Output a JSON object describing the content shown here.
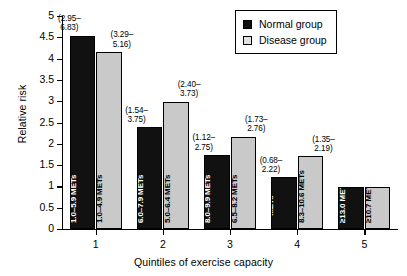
{
  "chart_data": {
    "type": "bar",
    "title": "",
    "xlabel": "Quintiles of exercise capacity",
    "ylabel": "Relative risk",
    "categories": [
      "1",
      "2",
      "3",
      "4",
      "5"
    ],
    "ylim": [
      0,
      5
    ],
    "ytick_labels": [
      "0",
      "0.5",
      "1",
      "1.5",
      "2",
      "2.5",
      "3",
      "3.5",
      "4",
      "4.5",
      "5"
    ],
    "ytick_values": [
      0,
      0.5,
      1,
      1.5,
      2,
      2.5,
      3,
      3.5,
      4,
      4.5,
      5
    ],
    "grid": false,
    "legend_position": "top-right",
    "series": [
      {
        "name": "Normal group",
        "color": "#111111",
        "values": [
          4.55,
          2.4,
          1.75,
          1.23,
          1.0
        ],
        "ci_labels": [
          "(2.95–\n6.83)",
          "(1.54–\n3.75)",
          "(1.12–\n2.75)",
          "(0.68–\n2.22)",
          ""
        ],
        "bar_labels": [
          "1.0–5.9 METs",
          "6.0–7.9 METs",
          "8.0–9.9 METs",
          "10.0–12.9\nMETs",
          "≥13.0 METs"
        ]
      },
      {
        "name": "Disease group",
        "color": "#c9c9c9",
        "values": [
          4.17,
          3.0,
          2.18,
          1.72,
          1.0
        ],
        "ci_labels": [
          "(3.29–\n5.16)",
          "(2.40–\n3.73)",
          "(1.73–\n2.76)",
          "(1.35–\n2.19)",
          ""
        ],
        "bar_labels": [
          "1.0–4.9 METs",
          "5.0–6.4 METs",
          "6.5–8.2 METs",
          "8.3–10.6 METs",
          "≥10.7 METs"
        ]
      }
    ]
  },
  "legend": {
    "items": [
      {
        "label": "Normal group",
        "swatch": "black-square-icon"
      },
      {
        "label": "Disease group",
        "swatch": "gray-square-icon"
      }
    ]
  }
}
